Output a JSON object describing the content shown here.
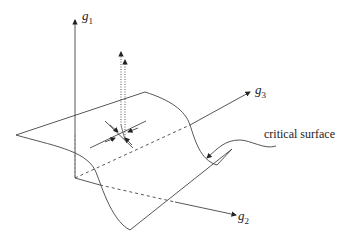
{
  "diagram": {
    "axes": {
      "g1": {
        "symbol": "g",
        "subscript": "1"
      },
      "g2": {
        "symbol": "g",
        "subscript": "2"
      },
      "g3": {
        "symbol": "g",
        "subscript": "3"
      }
    },
    "annotation": "critical surface",
    "colors": {
      "line": "#333333",
      "background": "#ffffff"
    }
  }
}
